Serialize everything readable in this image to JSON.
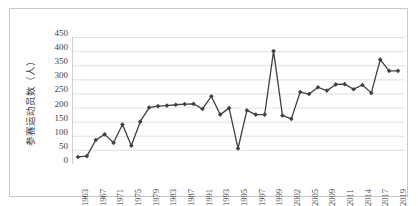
{
  "chart_data": {
    "type": "line",
    "title": "",
    "xlabel": "",
    "ylabel": "参赛运动员数（人）",
    "ylim": [
      0,
      450
    ],
    "yticks": [
      0,
      50,
      100,
      150,
      200,
      250,
      300,
      350,
      400,
      450
    ],
    "ytick_labels": [
      "0",
      "50",
      "100",
      "150",
      "200",
      "250",
      "300",
      "350",
      "400",
      "450"
    ],
    "grid": true,
    "legend": false,
    "marker": "diamond",
    "line_color": "#404040",
    "marker_color": "#404040",
    "grid_color": "#d9d9d9",
    "tick_labels_shown": [
      "1963",
      "1967",
      "1971",
      "1975",
      "1979",
      "1983",
      "1987",
      "1991",
      "1993",
      "1995",
      "1997",
      "1999",
      "2002",
      "2005",
      "2009",
      "2011",
      "2014",
      "2017",
      "2019"
    ],
    "x": [
      "1963",
      "1965",
      "1967",
      "1969",
      "1971",
      "1973",
      "1975",
      "1977",
      "1979",
      "1981",
      "1983",
      "1985",
      "1987",
      "1989",
      "1991",
      "1992",
      "1993",
      "1994",
      "1995",
      "1996",
      "1997",
      "1998",
      "1999",
      "2000",
      "2002",
      "2003",
      "2005",
      "2006",
      "2009",
      "2010",
      "2011",
      "2013",
      "2014",
      "2015",
      "2017",
      "2018",
      "2019"
    ],
    "values": [
      25,
      28,
      85,
      105,
      75,
      140,
      65,
      150,
      200,
      205,
      207,
      210,
      212,
      213,
      195,
      240,
      175,
      198,
      55,
      190,
      175,
      175,
      400,
      172,
      160,
      255,
      248,
      272,
      260,
      282,
      283,
      265,
      280,
      252,
      370,
      330,
      330
    ],
    "values_labeled": [
      {
        "year": "1963",
        "value": 25
      },
      {
        "year": "1967",
        "value": 85
      },
      {
        "year": "1971",
        "value": 75
      },
      {
        "year": "1975",
        "value": 65
      },
      {
        "year": "1979",
        "value": 200
      },
      {
        "year": "1983",
        "value": 207
      },
      {
        "year": "1987",
        "value": 212
      },
      {
        "year": "1991",
        "value": 195
      },
      {
        "year": "1993",
        "value": 175
      },
      {
        "year": "1995",
        "value": 55
      },
      {
        "year": "1997",
        "value": 175
      },
      {
        "year": "1999",
        "value": 400
      },
      {
        "year": "2002",
        "value": 160
      },
      {
        "year": "2005",
        "value": 248
      },
      {
        "year": "2009",
        "value": 260
      },
      {
        "year": "2011",
        "value": 283
      },
      {
        "year": "2014",
        "value": 280
      },
      {
        "year": "2017",
        "value": 370
      },
      {
        "year": "2019",
        "value": 330
      }
    ]
  }
}
